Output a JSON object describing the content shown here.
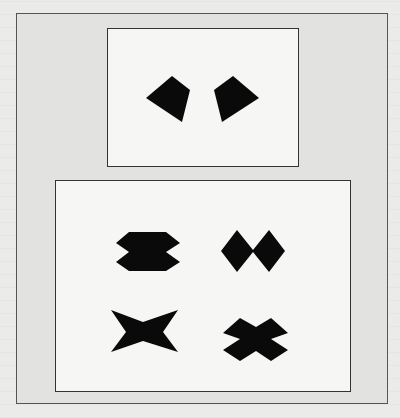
{
  "figure": {
    "colors": {
      "page": "#ebebe9",
      "plate": "#e2e2e0",
      "panel": "#f6f6f4",
      "shape_fill": "#0a0a0a",
      "border": "#333333"
    },
    "top_panel": {
      "shapes": [
        {
          "name": "left-arrowhead-shape",
          "points": "146,98 172,76 190,90 182,122"
        },
        {
          "name": "right-arrowhead-shape",
          "points": "259,98 233,76 214,90 222,122"
        }
      ]
    },
    "bottom_panel": {
      "shapes": [
        {
          "name": "stacked-hexagons-shape",
          "points": "116,243 129,232 166,232 180,243 166,252 180,262 166,271 129,271 116,262 129,252"
        },
        {
          "name": "double-diamond-shape",
          "points": "221,251 237,230 253,250 269,230 285,251 269,272 253,252 237,272"
        },
        {
          "name": "four-point-star-shape",
          "points": "111,310 143,322 178,310 163,332 178,352 143,341 111,352 126,332"
        },
        {
          "name": "x-cross-shape",
          "points": "223,333 240,318 256,327 271,318 288,333 271,339 288,350 271,361 256,351 240,361 223,350 240,339"
        }
      ]
    }
  }
}
